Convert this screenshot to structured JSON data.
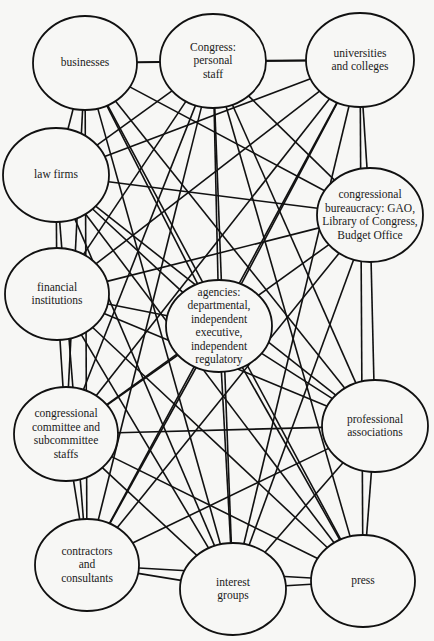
{
  "diagram": {
    "type": "network",
    "nodes": [
      {
        "id": "businesses",
        "label": [
          "businesses"
        ],
        "cx": 85,
        "cy": 63,
        "rx": 52,
        "ry": 47
      },
      {
        "id": "congress_personal_staff",
        "label": [
          "Congress:",
          "personal",
          "staff"
        ],
        "cx": 213,
        "cy": 61,
        "rx": 53,
        "ry": 47
      },
      {
        "id": "universities",
        "label": [
          "universities",
          "and colleges"
        ],
        "cx": 360,
        "cy": 60,
        "rx": 54,
        "ry": 47
      },
      {
        "id": "law_firms",
        "label": [
          "law firms"
        ],
        "cx": 56,
        "cy": 175,
        "rx": 53,
        "ry": 47
      },
      {
        "id": "congressional_bureaucracy",
        "label": [
          "congressional",
          "bureaucracy: GAO,",
          "Library of Congress,",
          "Budget Office"
        ],
        "cx": 370,
        "cy": 215,
        "rx": 53,
        "ry": 47
      },
      {
        "id": "financial_institutions",
        "label": [
          "financial",
          "institutions"
        ],
        "cx": 57,
        "cy": 294,
        "rx": 52,
        "ry": 46
      },
      {
        "id": "agencies",
        "label": [
          "agencies:",
          "departmental,",
          "independent",
          "executive,",
          "independent",
          "regulatory"
        ],
        "cx": 219,
        "cy": 326,
        "rx": 53,
        "ry": 46
      },
      {
        "id": "committee_staffs",
        "label": [
          "congressional",
          "committee and",
          "subcommittee",
          "staffs"
        ],
        "cx": 66,
        "cy": 434,
        "rx": 52,
        "ry": 47
      },
      {
        "id": "professional_associations",
        "label": [
          "professional",
          "associations"
        ],
        "cx": 375,
        "cy": 426,
        "rx": 53,
        "ry": 46
      },
      {
        "id": "contractors",
        "label": [
          "contractors",
          "and",
          "consultants"
        ],
        "cx": 87,
        "cy": 565,
        "rx": 52,
        "ry": 46
      },
      {
        "id": "interest_groups",
        "label": [
          "interest",
          "groups"
        ],
        "cx": 233,
        "cy": 589,
        "rx": 53,
        "ry": 46
      },
      {
        "id": "press",
        "label": [
          "press"
        ],
        "cx": 363,
        "cy": 581,
        "rx": 52,
        "ry": 46
      }
    ],
    "edges": [
      [
        "businesses",
        "congress_personal_staff"
      ],
      [
        "businesses",
        "law_firms"
      ],
      [
        "businesses",
        "congressional_bureaucracy"
      ],
      [
        "businesses",
        "agencies"
      ],
      [
        "businesses",
        "committee_staffs"
      ],
      [
        "businesses",
        "contractors"
      ],
      [
        "businesses",
        "interest_groups"
      ],
      [
        "businesses",
        "professional_associations"
      ],
      [
        "businesses",
        "press"
      ],
      [
        "congress_personal_staff",
        "universities"
      ],
      [
        "congress_personal_staff",
        "law_firms"
      ],
      [
        "congress_personal_staff",
        "financial_institutions"
      ],
      [
        "congress_personal_staff",
        "agencies"
      ],
      [
        "congress_personal_staff",
        "committee_staffs"
      ],
      [
        "congress_personal_staff",
        "contractors"
      ],
      [
        "congress_personal_staff",
        "interest_groups"
      ],
      [
        "congress_personal_staff",
        "press"
      ],
      [
        "congress_personal_staff",
        "professional_associations"
      ],
      [
        "congress_personal_staff",
        "congressional_bureaucracy"
      ],
      [
        "universities",
        "congressional_bureaucracy"
      ],
      [
        "universities",
        "law_firms"
      ],
      [
        "universities",
        "financial_institutions"
      ],
      [
        "universities",
        "agencies"
      ],
      [
        "universities",
        "committee_staffs"
      ],
      [
        "universities",
        "contractors"
      ],
      [
        "universities",
        "interest_groups"
      ],
      [
        "universities",
        "press"
      ],
      [
        "universities",
        "businesses"
      ],
      [
        "law_firms",
        "financial_institutions"
      ],
      [
        "law_firms",
        "congressional_bureaucracy"
      ],
      [
        "law_firms",
        "agencies"
      ],
      [
        "law_firms",
        "interest_groups"
      ],
      [
        "law_firms",
        "press"
      ],
      [
        "law_firms",
        "professional_associations"
      ],
      [
        "law_firms",
        "contractors"
      ],
      [
        "congressional_bureaucracy",
        "financial_institutions"
      ],
      [
        "congressional_bureaucracy",
        "professional_associations"
      ],
      [
        "congressional_bureaucracy",
        "committee_staffs"
      ],
      [
        "congressional_bureaucracy",
        "contractors"
      ],
      [
        "congressional_bureaucracy",
        "interest_groups"
      ],
      [
        "financial_institutions",
        "committee_staffs"
      ],
      [
        "financial_institutions",
        "agencies"
      ],
      [
        "financial_institutions",
        "professional_associations"
      ],
      [
        "financial_institutions",
        "interest_groups"
      ],
      [
        "financial_institutions",
        "press"
      ],
      [
        "agencies",
        "interest_groups"
      ],
      [
        "agencies",
        "committee_staffs"
      ],
      [
        "agencies",
        "contractors"
      ],
      [
        "agencies",
        "professional_associations"
      ],
      [
        "agencies",
        "press"
      ],
      [
        "committee_staffs",
        "contractors"
      ],
      [
        "committee_staffs",
        "professional_associations"
      ],
      [
        "committee_staffs",
        "interest_groups"
      ],
      [
        "committee_staffs",
        "press"
      ],
      [
        "professional_associations",
        "press"
      ],
      [
        "professional_associations",
        "interest_groups"
      ],
      [
        "professional_associations",
        "contractors"
      ],
      [
        "contractors",
        "interest_groups"
      ],
      [
        "contractors",
        "press"
      ],
      [
        "interest_groups",
        "press"
      ]
    ]
  }
}
